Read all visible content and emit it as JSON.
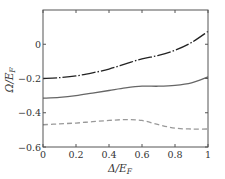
{
  "chart_data": {
    "type": "line",
    "title": "",
    "xlabel": "Δ/E_F",
    "ylabel": "Ω/E_F",
    "xlim": [
      0,
      1
    ],
    "ylim": [
      -0.6,
      0.2
    ],
    "xticks": [
      0,
      0.2,
      0.4,
      0.6,
      0.8,
      1
    ],
    "xtick_labels": [
      "0",
      "0.2",
      "0.4",
      "0.6",
      "0.8",
      "1"
    ],
    "yticks": [
      -0.6,
      -0.4,
      -0.2,
      0
    ],
    "ytick_labels": [
      "-0.6",
      "-0.4",
      "-0.2",
      "0"
    ],
    "grid": false,
    "legend": null,
    "x": [
      0,
      0.1,
      0.2,
      0.3,
      0.4,
      0.5,
      0.6,
      0.7,
      0.8,
      0.9,
      1.0
    ],
    "series": [
      {
        "name": "upper (dash-dot)",
        "style": "dash-dot",
        "color": "#222222",
        "values": [
          -0.2,
          -0.195,
          -0.185,
          -0.167,
          -0.145,
          -0.115,
          -0.085,
          -0.065,
          -0.035,
          0.01,
          0.075
        ]
      },
      {
        "name": "middle (solid)",
        "style": "solid",
        "color": "#666666",
        "values": [
          -0.315,
          -0.31,
          -0.3,
          -0.285,
          -0.27,
          -0.255,
          -0.245,
          -0.245,
          -0.24,
          -0.225,
          -0.19
        ]
      },
      {
        "name": "lower (dashed)",
        "style": "dashed",
        "color": "#999999",
        "values": [
          -0.47,
          -0.465,
          -0.46,
          -0.452,
          -0.445,
          -0.44,
          -0.445,
          -0.47,
          -0.49,
          -0.495,
          -0.495
        ]
      }
    ]
  },
  "labels": {
    "xlabel": "Δ/E",
    "xlabel_sub": "F",
    "ylabel": "Ω/E",
    "ylabel_sub": "F"
  }
}
